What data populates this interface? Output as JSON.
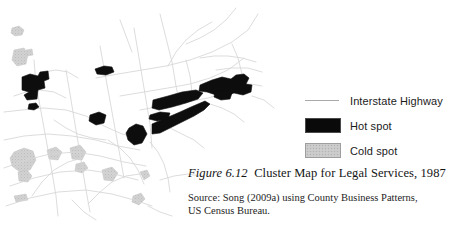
{
  "figure": {
    "number": "Figure 6.12",
    "title": "Cluster Map for Legal Services, 1987",
    "source": "Source: Song (2009a) using County Business Patterns,",
    "source_line2": "US Census Bureau."
  },
  "legend": {
    "items": [
      {
        "label": "Interstate Highway",
        "symbol": "line",
        "color": "#a9a9a9"
      },
      {
        "label": "Hot spot",
        "symbol": "swatch",
        "color": "#0a0a0a"
      },
      {
        "label": "Cold spot",
        "symbol": "swatch",
        "color": "#c9c9c9"
      }
    ]
  },
  "map": {
    "region": "Northeastern and Midwestern United States",
    "background": "#ffffff",
    "road_color": "#d6d6d6",
    "hot_color": "#0d0d0d",
    "cold_color": "#cfcfcf",
    "hot_spot_paths": [
      "M22,77 L30,74 L38,76 L40,72 L48,71 L49,79 L44,81 L45,88 L38,90 L37,99 L27,100 L24,95 L29,92 L22,90 Z",
      "M29,104 L36,103 L39,107 L34,110 L28,109 Z",
      "M95,69 L104,66 L112,67 L114,72 L106,75 L97,74 Z",
      "M90,115 L99,112 L106,115 L104,123 L96,125 L89,121 Z",
      "M129,128 L136,124 L143,126 L147,134 L142,143 L134,145 L128,140 L126,133 Z",
      "M152,124 L166,118 L180,112 L191,107 L198,104 L205,101 L210,104 L204,110 L194,116 L182,122 L170,128 L160,133 L152,134 Z",
      "M153,100 L168,96 L182,92 L196,90 L203,93 L198,99 L186,103 L172,107 L159,110 L152,108 Z",
      "M200,85 L212,80 L222,77 L231,79 L236,75 L244,74 L249,78 L246,84 L252,85 L251,92 L243,95 L234,93 L226,96 L216,95 L207,92 L199,91 Z",
      "M215,92 L224,90 L232,93 L230,99 L221,100 L214,97 Z",
      "M150,115 L160,112 L170,113 L168,119 L157,121 L149,119 Z"
    ],
    "cold_spot_paths": [
      "M12,28 L19,26 L24,30 L22,35 L15,36 L11,33 Z",
      "M14,50 L24,48 L28,54 L26,64 L17,66 L12,60 Z",
      "M26,50 L32,49 L33,55 L27,56 Z",
      "M14,152 L24,148 L33,151 L36,160 L30,170 L20,172 L12,166 L10,158 Z",
      "M18,172 L27,170 L32,176 L28,182 L19,181 Z",
      "M47,150 L56,147 L62,152 L58,160 L49,159 Z",
      "M70,148 L80,145 L86,152 L82,160 L72,159 Z",
      "M76,164 L84,162 L88,168 L82,173 L75,171 Z",
      "M102,170 L112,167 L118,173 L113,181 L104,180 Z",
      "M14,196 L26,194 L28,200 L16,202 Z",
      "M133,196 L141,193 L145,199 L139,205 L132,202 Z",
      "M140,172 L147,170 L150,176 L144,180 Z"
    ],
    "road_paths": [
      "M4,112 L22,110 L44,108 L66,110 L86,116 L104,126 L122,134 L140,138",
      "M4,140 L24,136 L48,134 L72,136 L96,140 L118,146 L140,150",
      "M4,168 L26,160 L50,154 L76,152 L100,156 L124,162 L146,166",
      "M10,186 L34,178 L60,172 L88,170 L114,174 L138,180",
      "M6,206 L30,198 L58,192 L86,190 L112,194 L134,200 L152,206",
      "M34,60 L36,84 L40,106 L44,128 L48,150 L52,172 L56,196 L58,216",
      "M66,70 L70,94 L74,118 L78,142 L82,166 L86,190 L90,212",
      "M100,46 L104,68 L108,90 L112,112 L116,134 L120,156 L124,178",
      "M134,28 L138,52 L142,76 L146,100 L150,124 L152,148",
      "M160,14 L166,38 L172,62 L176,86 L180,106",
      "M96,78 L118,74 L142,70 L166,66 L190,60 L212,52 L232,42 L248,30 L258,14",
      "M120,96 L144,92 L168,88 L190,84 L210,78 L228,70 L244,58",
      "M140,110 L162,106 L186,102 L208,98 L228,92",
      "M186,44 L200,38 L214,30 L226,20 L236,8",
      "M168,66 L176,52 L186,40 L198,30 L212,22",
      "M200,58 L214,56 L228,56 L242,58 L256,62",
      "M216,70 L232,68 L248,68 L262,72",
      "M54,120 L66,128 L78,134 L92,138 L106,140",
      "M108,140 L120,148 L130,158 L138,170 L144,184",
      "M150,142 L158,152 L164,164 L168,178 L170,192",
      "M32,196 L42,182 L54,170 L68,162 L82,158",
      "M88,204 L100,192 L112,182 L126,176 L140,174",
      "M170,128 L182,134 L194,140 L204,148",
      "M160,180 L174,176 L188,174 L200,176",
      "M14,96 L26,92 L40,90 L54,92 L66,98",
      "M44,72 L56,70 L68,72 L78,78",
      "M210,104 L222,108 L234,114 L244,122",
      "M238,86 L250,84 L262,86",
      "M252,96 L264,100 L274,108",
      "M186,60 L190,76 L192,92",
      "M232,44 L238,58 L242,74",
      "M120,20 L126,36 L132,52",
      "M72,200 L84,212 L96,220",
      "M148,206 L160,212 L172,216"
    ]
  }
}
